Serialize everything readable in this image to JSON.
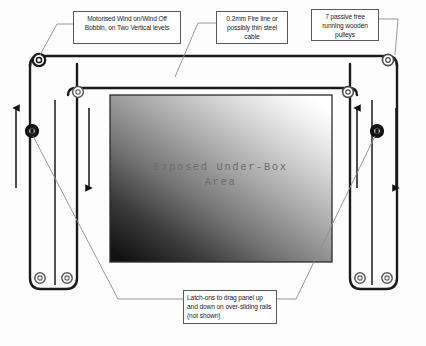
{
  "diagram": {
    "background_color": "#fdfdfd",
    "ink_color": "#1b1b1b",
    "leader_line_color": "#8a8a8a",
    "callouts": [
      {
        "id": "bobbin",
        "text": "Motorised Wind on/Wind Off Bobbin, on Two Vertical levels"
      },
      {
        "id": "fireline",
        "text": "0.2mm Fire line or possibly thin steel cable"
      },
      {
        "id": "pulleys",
        "text": "7 passive free running wooden pulleys"
      },
      {
        "id": "latchons",
        "text": "Latch-ons to drag panel up and down on over-sliding rails (not shown)"
      }
    ],
    "center_label": {
      "text": "Exposed Under-Box\nArea",
      "color": "#6d6d72"
    },
    "gradient_panel": {
      "description": "Shaded under-box area, light at top-right fading to dark at bottom-left",
      "light_color": "#ffffff",
      "dark_color": "#141414"
    },
    "motion_arrows": [
      {
        "id": "outer-left-arrow",
        "direction": "up"
      },
      {
        "id": "inner-left-arrow",
        "direction": "down"
      },
      {
        "id": "inner-right-arrow",
        "direction": "up"
      },
      {
        "id": "outer-right-arrow",
        "direction": "down"
      }
    ],
    "pulley_count": 7,
    "pulleys": [
      {
        "id": "outer-top-left",
        "type": "corner-pulley"
      },
      {
        "id": "outer-top-right",
        "type": "corner-pulley"
      },
      {
        "id": "inner-top-left",
        "type": "corner-pulley"
      },
      {
        "id": "inner-top-right",
        "type": "corner-pulley"
      },
      {
        "id": "outer-bottom-left-inner",
        "type": "foot-pulley"
      },
      {
        "id": "outer-bottom-left-outer",
        "type": "foot-pulley"
      },
      {
        "id": "outer-bottom-right-inner",
        "type": "foot-pulley"
      },
      {
        "id": "outer-bottom-right-outer",
        "type": "foot-pulley"
      }
    ],
    "bobbins": [
      {
        "id": "left-bobbin",
        "type": "motorised-bobbin"
      },
      {
        "id": "right-bobbin",
        "type": "motorised-bobbin"
      }
    ]
  }
}
